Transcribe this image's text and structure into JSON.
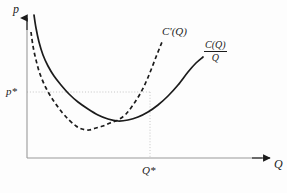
{
  "figure": {
    "background_color": "#fdfdfd",
    "ink_color": "#1b1b1b",
    "axis_color": "#8a8a8a",
    "guide_color": "#bfbfbf",
    "axes": {
      "y_axis_label": "p",
      "x_axis_label": "Q",
      "origin_x": 27,
      "origin_y": 158
    },
    "markers": {
      "price_label": "p*",
      "quantity_label": "Q*",
      "price_y": 92,
      "quantity_x": 150
    },
    "curve_labels": {
      "marginal_cost": "C'(Q)",
      "average_cost_numerator": "C(Q)",
      "average_cost_denominator": "Q"
    }
  },
  "chart_data": {
    "type": "line",
    "title": "",
    "xlabel": "Q",
    "ylabel": "p",
    "grid": false,
    "legend": "inline-curve-labels",
    "xlim": [
      0,
      287
    ],
    "ylim": [
      0,
      193
    ],
    "annotations": [
      {
        "name": "p-star",
        "text": "p*",
        "axis": "y",
        "value": 92
      },
      {
        "name": "Q-star",
        "text": "Q*",
        "axis": "x",
        "value": 150
      },
      {
        "name": "marginal-cost-label",
        "text": "C'(Q)",
        "x": 165,
        "y": 33
      },
      {
        "name": "average-cost-label",
        "text": "C(Q)/Q",
        "x": 210,
        "y": 52
      }
    ],
    "guides": [
      {
        "name": "horizontal-price-guide",
        "orientation": "horizontal",
        "from": [
          27,
          92
        ],
        "to": [
          150,
          92
        ],
        "style": "dotted"
      },
      {
        "name": "vertical-quantity-guide",
        "orientation": "vertical",
        "from": [
          150,
          92
        ],
        "to": [
          150,
          158
        ],
        "style": "dotted"
      }
    ],
    "series": [
      {
        "name": "C(Q)/Q",
        "label": "average cost",
        "style": "solid",
        "color": "#1b1b1b",
        "points": [
          [
            34,
            15
          ],
          [
            36,
            28
          ],
          [
            39,
            42
          ],
          [
            43,
            55
          ],
          [
            48,
            66
          ],
          [
            54,
            76
          ],
          [
            61,
            85
          ],
          [
            69,
            94
          ],
          [
            78,
            102
          ],
          [
            88,
            109
          ],
          [
            98,
            115
          ],
          [
            108,
            119
          ],
          [
            118,
            121
          ],
          [
            128,
            120
          ],
          [
            138,
            117
          ],
          [
            148,
            112
          ],
          [
            158,
            105
          ],
          [
            168,
            96
          ],
          [
            178,
            85
          ],
          [
            188,
            72
          ],
          [
            196,
            63
          ],
          [
            203,
            57
          ]
        ]
      },
      {
        "name": "C'(Q)",
        "label": "marginal cost",
        "style": "dashed",
        "color": "#1b1b1b",
        "points": [
          [
            31,
            32
          ],
          [
            33,
            46
          ],
          [
            36,
            60
          ],
          [
            40,
            74
          ],
          [
            46,
            88
          ],
          [
            53,
            100
          ],
          [
            61,
            111
          ],
          [
            69,
            120
          ],
          [
            76,
            126
          ],
          [
            82,
            129
          ],
          [
            89,
            130
          ],
          [
            96,
            128
          ],
          [
            103,
            126
          ],
          [
            110,
            123
          ],
          [
            118,
            120
          ],
          [
            126,
            114
          ],
          [
            133,
            105
          ],
          [
            140,
            94
          ],
          [
            146,
            82
          ],
          [
            151,
            70
          ],
          [
            156,
            57
          ],
          [
            160,
            47
          ],
          [
            162,
            42
          ]
        ]
      }
    ]
  }
}
